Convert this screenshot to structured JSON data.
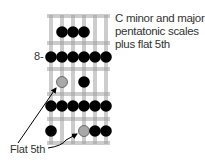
{
  "caption": {
    "line1": "C minor and major",
    "line2": "pentatonic scales",
    "line3": "plus flat 5th"
  },
  "fret_marker": "8-",
  "callout_label": "Flat 5th",
  "colors": {
    "note": "#000000",
    "flat5": "#a8a8a8",
    "string": "#9a9a9a",
    "fret": "#9a9a9a",
    "text": "#333333"
  },
  "fretboard": {
    "strings": 6,
    "frets_shown": 5,
    "starting_fret_label": "8-",
    "notes": [
      {
        "row": 1,
        "string": 2,
        "type": "scale"
      },
      {
        "row": 1,
        "string": 3,
        "type": "scale"
      },
      {
        "row": 1,
        "string": 4,
        "type": "scale"
      },
      {
        "row": 2,
        "string": 1,
        "type": "scale"
      },
      {
        "row": 2,
        "string": 2,
        "type": "scale"
      },
      {
        "row": 2,
        "string": 3,
        "type": "scale"
      },
      {
        "row": 2,
        "string": 4,
        "type": "scale"
      },
      {
        "row": 2,
        "string": 5,
        "type": "scale"
      },
      {
        "row": 2,
        "string": 6,
        "type": "scale"
      },
      {
        "row": 3,
        "string": 2,
        "type": "flat5"
      },
      {
        "row": 3,
        "string": 4,
        "type": "scale"
      },
      {
        "row": 4,
        "string": 1,
        "type": "scale"
      },
      {
        "row": 4,
        "string": 2,
        "type": "scale"
      },
      {
        "row": 4,
        "string": 3,
        "type": "scale"
      },
      {
        "row": 4,
        "string": 4,
        "type": "scale"
      },
      {
        "row": 4,
        "string": 5,
        "type": "scale"
      },
      {
        "row": 4,
        "string": 6,
        "type": "scale"
      },
      {
        "row": 5,
        "string": 1,
        "type": "scale"
      },
      {
        "row": 5,
        "string": 4,
        "type": "flat5"
      },
      {
        "row": 5,
        "string": 5,
        "type": "scale"
      },
      {
        "row": 5,
        "string": 6,
        "type": "scale"
      }
    ]
  }
}
